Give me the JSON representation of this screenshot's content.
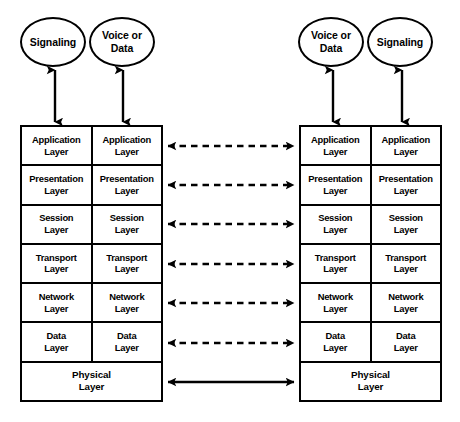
{
  "diagram": {
    "line_color": "#000000",
    "background_color": "#ffffff"
  },
  "endpoints": [
    {
      "id": "left-signaling",
      "label": "Signaling",
      "side": "left",
      "column": "signaling"
    },
    {
      "id": "left-voice-data",
      "label": "Voice or\nData",
      "side": "left",
      "column": "voice-data"
    },
    {
      "id": "right-voice-data",
      "label": "Voice or\nData",
      "side": "right",
      "column": "voice-data"
    },
    {
      "id": "right-signaling",
      "label": "Signaling",
      "side": "right",
      "column": "signaling"
    }
  ],
  "stacks": {
    "left": {
      "id": "left-stack",
      "columns": [
        "Signaling",
        "Voice or Data"
      ],
      "layers": [
        {
          "name": "application",
          "left_label": "Application\nLayer",
          "right_label": "Application\nLayer",
          "merged": false
        },
        {
          "name": "presentation",
          "left_label": "Presentation\nLayer",
          "right_label": "Presentation\nLayer",
          "merged": false
        },
        {
          "name": "session",
          "left_label": "Session\nLayer",
          "right_label": "Session\nLayer",
          "merged": false
        },
        {
          "name": "transport",
          "left_label": "Transport\nLayer",
          "right_label": "Transport\nLayer",
          "merged": false
        },
        {
          "name": "network",
          "left_label": "Network\nLayer",
          "right_label": "Network\nLayer",
          "merged": false
        },
        {
          "name": "data",
          "left_label": "Data\nLayer",
          "right_label": "Data\nLayer",
          "merged": false
        },
        {
          "name": "physical",
          "left_label": "Physical\nLayer",
          "right_label": "",
          "merged": true
        }
      ]
    },
    "right": {
      "id": "right-stack",
      "columns": [
        "Voice or Data",
        "Signaling"
      ],
      "layers": [
        {
          "name": "application",
          "left_label": "Application\nLayer",
          "right_label": "Application\nLayer",
          "merged": false
        },
        {
          "name": "presentation",
          "left_label": "Presentation\nLayer",
          "right_label": "Presentation\nLayer",
          "merged": false
        },
        {
          "name": "session",
          "left_label": "Session\nLayer",
          "right_label": "Session\nLayer",
          "merged": false
        },
        {
          "name": "transport",
          "left_label": "Transport\nLayer",
          "right_label": "Transport\nLayer",
          "merged": false
        },
        {
          "name": "network",
          "left_label": "Network\nLayer",
          "right_label": "Network\nLayer",
          "merged": false
        },
        {
          "name": "data",
          "left_label": "Data\nLayer",
          "right_label": "Data\nLayer",
          "merged": false
        },
        {
          "name": "physical",
          "left_label": "Physical\nLayer",
          "right_label": "",
          "merged": true
        }
      ]
    }
  },
  "peer_connections": [
    {
      "layer": "application",
      "style": "dashed",
      "heads": "both"
    },
    {
      "layer": "presentation",
      "style": "dashed",
      "heads": "both"
    },
    {
      "layer": "session",
      "style": "dashed",
      "heads": "both"
    },
    {
      "layer": "transport",
      "style": "dashed",
      "heads": "both"
    },
    {
      "layer": "network",
      "style": "dashed",
      "heads": "both"
    },
    {
      "layer": "data",
      "style": "dashed",
      "heads": "both"
    },
    {
      "layer": "physical",
      "style": "solid",
      "heads": "both"
    }
  ],
  "endpoint_connections": [
    {
      "endpoint": "left-signaling",
      "style": "solid",
      "heads": "both"
    },
    {
      "endpoint": "left-voice-data",
      "style": "solid",
      "heads": "both"
    },
    {
      "endpoint": "right-voice-data",
      "style": "solid",
      "heads": "both"
    },
    {
      "endpoint": "right-signaling",
      "style": "solid",
      "heads": "both"
    }
  ]
}
